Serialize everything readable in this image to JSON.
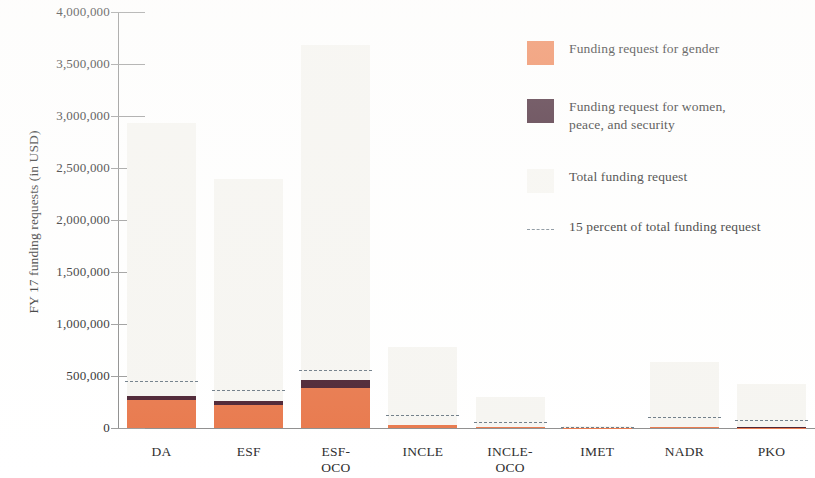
{
  "chart_data": {
    "type": "bar",
    "title": "",
    "subtitle": "",
    "xlabel": "",
    "ylabel": "FY 17 funding requests (in USD)",
    "ylim": [
      0,
      4000000
    ],
    "ytick_step": 500000,
    "ytick_labels": [
      "4,000,000",
      "3,500,000",
      "3,000,000",
      "2,500,000",
      "2,000,000",
      "1,500,000",
      "1,000,000",
      "500,000",
      "0"
    ],
    "ytick_values": [
      4000000,
      3500000,
      3000000,
      2500000,
      2000000,
      1500000,
      1000000,
      500000,
      0
    ],
    "grid": false,
    "stacked": true,
    "legend_position": "right",
    "categories": [
      "DA",
      "ESF",
      "ESF-OCO",
      "INCLE",
      "INCLE-OCO",
      "IMET",
      "NADR",
      "PKO"
    ],
    "series": [
      {
        "name": "Funding request for gender",
        "color": "#e8774a",
        "values": [
          269000,
          221000,
          385000,
          28000,
          9000,
          1000,
          6000,
          4000
        ]
      },
      {
        "name": "Funding request for women, peace, and security",
        "color": "#4a2030",
        "values": [
          38000,
          38000,
          77000,
          4000,
          2000,
          0,
          2000,
          2000
        ]
      },
      {
        "name": "Total funding request",
        "color": "#f6f5f1",
        "values": [
          2930000,
          2390000,
          3680000,
          780000,
          300000,
          15000,
          635000,
          420000
        ]
      }
    ],
    "reference_line": {
      "name": "15 percent of total funding request",
      "color": "#6d7b86",
      "style": "dashed",
      "percent_of_total": 15,
      "values": [
        439500,
        358500,
        552000,
        117000,
        45000,
        2250,
        95250,
        63000
      ]
    }
  },
  "legend": {
    "items": [
      {
        "label": "Funding request for gender",
        "label_line2": "",
        "swatch": "gender"
      },
      {
        "label": "Funding request for women,",
        "label_line2": "peace, and security",
        "swatch": "wps"
      },
      {
        "label": "Total funding request",
        "label_line2": "",
        "swatch": "total"
      },
      {
        "label": "15 percent of total funding request",
        "label_line2": "",
        "swatch": "dashed"
      }
    ]
  },
  "axis": {
    "y_title": "FY 17 funding requests (in USD)"
  }
}
